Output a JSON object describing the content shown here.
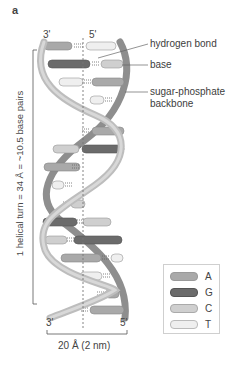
{
  "figure": {
    "panel_letter": "a",
    "top_ends": {
      "left": "3'",
      "right": "5'"
    },
    "bottom_ends": {
      "left": "3'",
      "right": "5'"
    },
    "annotations": {
      "hydrogen_bond": "hydrogen bond",
      "base": "base",
      "backbone_line1": "sugar-phosphate",
      "backbone_line2": "backbone"
    },
    "helical_turn_label": "1 helical turn = 34 Å = ~10.5 base pairs",
    "width_label": "20 Å (2 nm)"
  },
  "legend": {
    "items": [
      {
        "label": "A",
        "color": "#a9a9a9"
      },
      {
        "label": "G",
        "color": "#6b6b6b"
      },
      {
        "label": "C",
        "color": "#cfcfcf"
      },
      {
        "label": "T",
        "color": "#efefef"
      }
    ]
  },
  "colors": {
    "backbone": "#bdbdbd",
    "backbone_dark": "#8e8e8e",
    "axis": "#777777",
    "A": "#a9a9a9",
    "G": "#6b6b6b",
    "C": "#cfcfcf",
    "T": "#efefef"
  }
}
